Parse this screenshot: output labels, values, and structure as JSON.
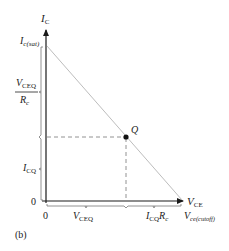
{
  "figure": {
    "caption": "(b)",
    "axes": {
      "y_label_main": "I",
      "y_label_sub": "C",
      "x_label_main": "V",
      "x_label_sub": "CE",
      "origin_x": "0",
      "origin_y": "0"
    },
    "y_labels": {
      "sat_main": "I",
      "sat_sub": "c(sat)",
      "frac_num_main": "V",
      "frac_num_sub": "CEQ",
      "frac_den_main": "R",
      "frac_den_sub": "c",
      "icq_main": "I",
      "icq_sub": "CQ"
    },
    "x_labels": {
      "vceq_main": "V",
      "vceq_sub": "CEQ",
      "icqrc_main": "I",
      "icqrc_sub": "CQ",
      "icqrc_tail": "R",
      "icqrc_tail_sub": "c",
      "cutoff_main": "V",
      "cutoff_sub": "ce(cutoff)"
    },
    "q_point": {
      "label": "Q"
    },
    "colors": {
      "axis": "#1a1a1a",
      "load_line": "#b8b8b8",
      "dashed": "#666666",
      "point": "#111111"
    }
  }
}
